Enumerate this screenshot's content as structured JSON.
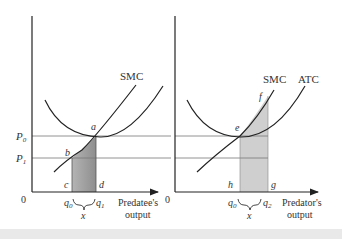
{
  "colors": {
    "ink": "#222222",
    "price_line": "#666666",
    "shade_dark": "#9a9a9a",
    "shade_light": "#cfcfcf",
    "background": "#ffffff"
  },
  "left_panel": {
    "origin_label": "0",
    "price_labels": {
      "p0": "P",
      "p0_sub": "0",
      "p1": "P",
      "p1_sub": "1"
    },
    "curve_labels": {
      "smc": "SMC"
    },
    "point_labels": {
      "a": "a",
      "b": "b",
      "c": "c",
      "d": "d"
    },
    "axis_labels": {
      "q0": "q",
      "q0_sub": "0",
      "q1": "q",
      "q1_sub": "1",
      "brace": "x"
    },
    "x_axis_title": [
      "Predatee's",
      "output"
    ]
  },
  "right_panel": {
    "origin_label": "0",
    "curve_labels": {
      "smc": "SMC",
      "atc": "ATC"
    },
    "point_labels": {
      "e": "e",
      "f": "f",
      "h": "h",
      "g": "g"
    },
    "axis_labels": {
      "q0": "q",
      "q0_sub": "0",
      "q2": "q",
      "q2_sub": "2",
      "brace": "x"
    },
    "x_axis_title": [
      "Predator's",
      "output"
    ]
  }
}
